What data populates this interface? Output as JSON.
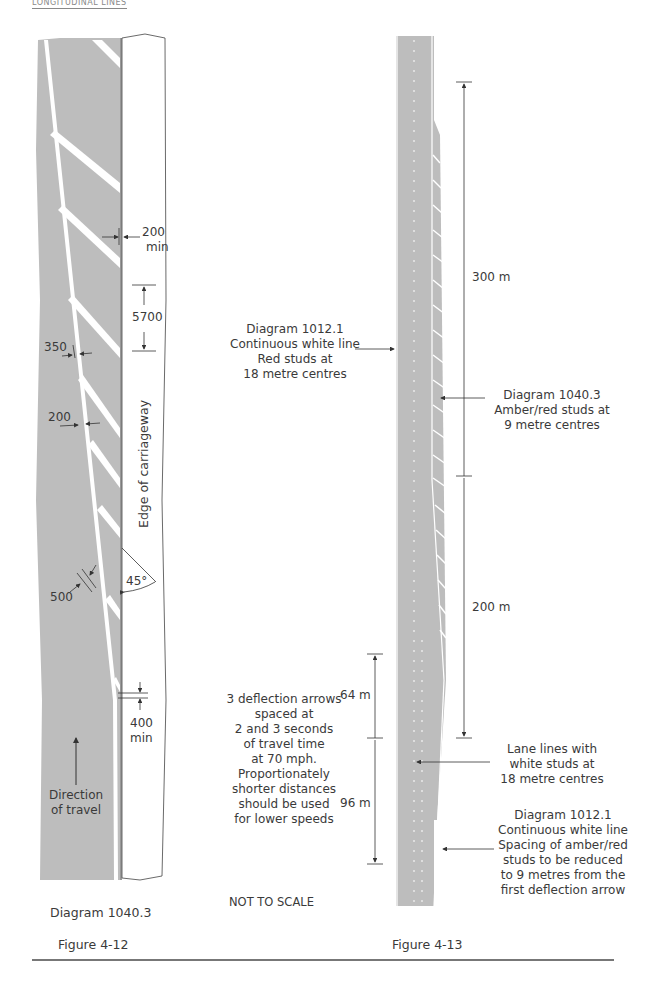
{
  "page": {
    "running_header": "LONGITUDINAL LINES",
    "colors": {
      "road_grey": "#bdbdbd",
      "marking_white": "#ffffff",
      "line_dark": "#3a3a3a"
    }
  },
  "figure_4_12": {
    "caption": "Figure 4-12",
    "diagram_label": "Diagram 1040.3",
    "edge_label": "Edge of carriageway",
    "direction_label_line1": "Direction",
    "direction_label_line2": "of travel",
    "dimensions": {
      "min_gap_top": "200",
      "min_gap_top_unit": "min",
      "stripe_spacing": "5700",
      "line_width_wide": "350",
      "line_width_narrow": "200",
      "stripe_width": "500",
      "angle": "45°",
      "min_gap_bottom": "400",
      "min_gap_bottom_unit": "min"
    }
  },
  "figure_4_13": {
    "caption": "Figure 4-13",
    "scale_note": "NOT TO SCALE",
    "dimensions": {
      "upper_length": "300 m",
      "taper_length": "200 m",
      "arrow_spacing_1": "64 m",
      "arrow_spacing_2": "96 m"
    },
    "annotations": {
      "left_edge": [
        "Diagram 1012.1",
        "Continuous white line",
        "Red studs at",
        "18 metre centres"
      ],
      "hatched": [
        "Diagram 1040.3",
        "Amber/red studs at",
        "9 metre centres"
      ],
      "deflection": [
        "3 deflection arrows",
        "spaced at",
        "2 and 3 seconds",
        "of travel time",
        "at 70 mph.",
        "Proportionately",
        "shorter distances",
        "should be used",
        "for lower speeds"
      ],
      "lane_lines": [
        "Lane lines with",
        "white studs at",
        "18 metre centres"
      ],
      "right_edge": [
        "Diagram 1012.1",
        "Continuous white line",
        "Spacing of amber/red",
        "studs to be reduced",
        "to 9 metres from the",
        "first deflection arrow"
      ]
    }
  }
}
